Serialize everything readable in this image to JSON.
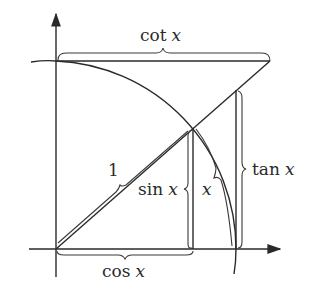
{
  "diagram": {
    "labels": {
      "cot": {
        "fn": "cot",
        "var": "x"
      },
      "one": "1",
      "sin": {
        "fn": "sin",
        "var": "x"
      },
      "arc": {
        "var": "x"
      },
      "tan": {
        "fn": "tan",
        "var": "x"
      },
      "cos": {
        "fn": "cos",
        "var": "x"
      }
    },
    "colors": {
      "ink": "#2a2a2a",
      "background": "#ffffff"
    }
  }
}
